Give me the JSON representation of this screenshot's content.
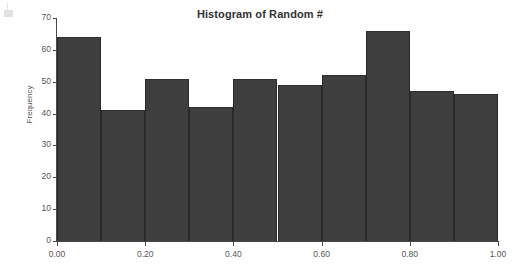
{
  "chart_data": {
    "type": "bar",
    "title": "Histogram of Random #",
    "xlabel": "",
    "ylabel": "Frequency",
    "categories": [
      "0.0-0.1",
      "0.1-0.2",
      "0.2-0.3",
      "0.3-0.4",
      "0.4-0.5",
      "0.5-0.6",
      "0.6-0.7",
      "0.7-0.8",
      "0.8-0.9",
      "0.9-1.0"
    ],
    "bin_edges": [
      0.0,
      0.1,
      0.2,
      0.3,
      0.4,
      0.5,
      0.6,
      0.7,
      0.8,
      0.9,
      1.0
    ],
    "values": [
      64,
      41,
      51,
      42,
      51,
      49,
      52,
      66,
      47,
      46
    ],
    "xlim": [
      0.0,
      1.0
    ],
    "ylim": [
      0,
      70
    ],
    "y_ticks": [
      0,
      10,
      20,
      30,
      40,
      50,
      60,
      70
    ],
    "y_tick_labels": [
      "0",
      "10",
      "20",
      "30",
      "40",
      "50",
      "60",
      "70"
    ],
    "x_ticks": [
      0.0,
      0.2,
      0.4,
      0.6,
      0.8,
      1.0
    ],
    "x_tick_labels": [
      "0.00",
      "0.20",
      "0.40",
      "0.60",
      "0.80",
      "1.00"
    ],
    "grid": false,
    "legend": null,
    "bar_color": "#3e3e3e",
    "bar_edge_color": "#2a2a2a",
    "axis_color": "#4a4a4a",
    "text_color": "#555555",
    "title_color": "#333333",
    "background": "#ffffff"
  }
}
